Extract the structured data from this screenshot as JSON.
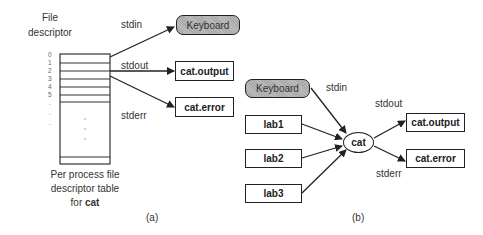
{
  "diagram_a": {
    "heading_line1": "File",
    "heading_line2": "descriptor",
    "indices": [
      "0",
      "1",
      "2",
      "3",
      "4",
      "5",
      ".",
      ".",
      "."
    ],
    "streams": {
      "stdin": "stdin",
      "stdout": "stdout",
      "stderr": "stderr"
    },
    "targets": {
      "keyboard": "Keyboard",
      "output": "cat.output",
      "error": "cat.error"
    },
    "table_caption_line1": "Per process file",
    "table_caption_line2": "descriptor table",
    "table_caption_line3_prefix": "for ",
    "table_caption_line3_bold": "cat",
    "label": "(a)"
  },
  "diagram_b": {
    "keyboard": "Keyboard",
    "inputs": [
      "lab1",
      "lab2",
      "lab3"
    ],
    "process": "cat",
    "streams": {
      "stdin": "stdin",
      "stdout": "stdout",
      "stderr": "stderr"
    },
    "targets": {
      "output": "cat.output",
      "error": "cat.error"
    },
    "label": "(b)"
  },
  "colors": {
    "keyboard_fill": "#b0b0b0",
    "stroke": "#222222"
  }
}
